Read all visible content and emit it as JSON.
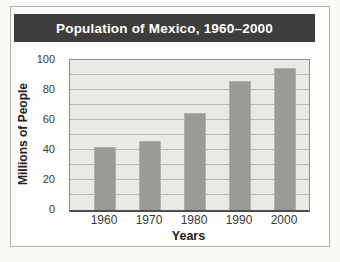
{
  "chart_data": {
    "type": "bar",
    "title": "Population of Mexico, 1960–2000",
    "categories": [
      "1960",
      "1970",
      "1980",
      "1990",
      "2000"
    ],
    "values": [
      42,
      46,
      65,
      86,
      95
    ],
    "xlabel": "Years",
    "ylabel": "Millions of People",
    "ylim": [
      0,
      100
    ],
    "yticks": [
      0,
      20,
      40,
      60,
      80,
      100
    ],
    "gridline_step": 10,
    "grid": true,
    "legend": false,
    "colors": {
      "title_bar": "#3e3d3c",
      "title_text": "#ffffff",
      "bar": "#9c9a95",
      "plot_background": "#eae9e5",
      "gridline": "#b8b6b1"
    }
  }
}
